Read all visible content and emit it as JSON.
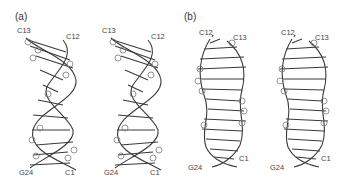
{
  "figure": {
    "panels": [
      {
        "id": "a",
        "label": "(a)",
        "stereo_views": [
          {
            "top_left": "C13",
            "top_right": "C12",
            "bottom_left": "G24",
            "bottom_right": "C1"
          },
          {
            "top_left": "C13",
            "top_right": "C12",
            "bottom_left": "G24",
            "bottom_right": "C1"
          }
        ]
      },
      {
        "id": "b",
        "label": "(b)",
        "stereo_views": [
          {
            "top_left": "C12",
            "top_right": "C13",
            "bottom_left": "G24",
            "bottom_right": "C1"
          },
          {
            "top_left": "C12",
            "top_right": "C13",
            "bottom_left": "G24",
            "bottom_right": "C1"
          }
        ]
      }
    ],
    "colors": {
      "stroke": "#3a3a3a",
      "light_stroke": "#7a7a7a",
      "background": "#ffffff"
    }
  }
}
